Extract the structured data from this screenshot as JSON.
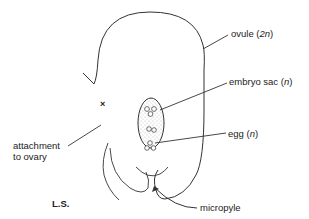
{
  "diagram": {
    "type": "botanical-section",
    "section_label": "L.S.",
    "labels": {
      "ovule": {
        "text": "ovule (",
        "ploidy": "2n",
        "close": ")"
      },
      "embryo_sac": {
        "text": "embryo sac (",
        "ploidy": "n",
        "close": ")"
      },
      "egg": {
        "text": "egg (",
        "ploidy": "n",
        "close": ")"
      },
      "attachment_line1": "attachment",
      "attachment_line2": "to ovary",
      "micropyle": "micropyle",
      "attachment_marker": "×"
    },
    "colors": {
      "stroke": "#333333",
      "text": "#222222",
      "stipple": "#777777",
      "background": "#ffffff"
    }
  }
}
